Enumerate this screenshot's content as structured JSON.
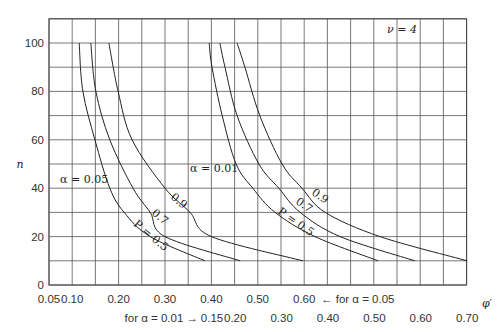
{
  "chart_data": {
    "type": "line",
    "title": "",
    "annotation_nu": "ν = 4",
    "ylabel": "n",
    "xlabel": "φ′",
    "ylim": [
      0,
      110
    ],
    "yticks": [
      0,
      20,
      40,
      60,
      80,
      100
    ],
    "ygrid_step": 10,
    "grid": true,
    "x_scale_alpha_005": {
      "label": "← for α = 0.05",
      "range": [
        0.05,
        0.7
      ],
      "ticks": [
        "0.05",
        "0.10",
        "0.20",
        "0.30",
        "0.40",
        "0.50",
        "0.60"
      ]
    },
    "x_scale_alpha_001": {
      "label": "for α = 0.01 →",
      "range": [
        0.15,
        0.7
      ],
      "ticks": [
        "0.15",
        "0.20",
        "0.30",
        "0.40",
        "0.50",
        "0.60",
        "0.70"
      ]
    },
    "group_labels": [
      "α = 0.05",
      "α = 0.01"
    ],
    "curve_labels": {
      "p05": "P = 0.5",
      "p07": "0.7",
      "p09": "0.9"
    },
    "series": [
      {
        "name": "α=0.05, P=0.5",
        "alpha": 0.05,
        "P": 0.5,
        "n": [
          100,
          80,
          60,
          40,
          30,
          20,
          10
        ],
        "phi": [
          0.115,
          0.123,
          0.149,
          0.181,
          0.212,
          0.268,
          0.386
        ]
      },
      {
        "name": "α=0.05, P=0.7",
        "alpha": 0.05,
        "P": 0.7,
        "n": [
          100,
          80,
          60,
          40,
          30,
          20,
          10
        ],
        "phi": [
          0.14,
          0.151,
          0.181,
          0.231,
          0.268,
          0.3,
          0.462
        ]
      },
      {
        "name": "α=0.05, P=0.9",
        "alpha": 0.05,
        "P": 0.9,
        "n": [
          100,
          80,
          60,
          40,
          30,
          20,
          10
        ],
        "phi": [
          0.179,
          0.199,
          0.229,
          0.3,
          0.354,
          0.4,
          0.597
        ]
      },
      {
        "name": "α=0.01, P=0.5",
        "alpha": 0.01,
        "P": 0.5,
        "n": [
          100,
          90,
          70,
          50,
          40,
          30,
          20,
          10
        ],
        "phi": [
          0.144,
          0.15,
          0.172,
          0.202,
          0.238,
          0.286,
          0.372,
          0.508
        ]
      },
      {
        "name": "α=0.01, P=0.7",
        "alpha": 0.01,
        "P": 0.7,
        "n": [
          100,
          90,
          70,
          50,
          40,
          30,
          20,
          10
        ],
        "phi": [
          0.167,
          0.178,
          0.204,
          0.251,
          0.294,
          0.34,
          0.426,
          0.587
        ]
      },
      {
        "name": "α=0.01, P=0.9",
        "alpha": 0.01,
        "P": 0.9,
        "n": [
          100,
          90,
          70,
          50,
          40,
          30,
          20,
          10
        ],
        "phi": [
          0.204,
          0.221,
          0.253,
          0.301,
          0.344,
          0.394,
          0.512,
          0.7
        ]
      }
    ]
  }
}
